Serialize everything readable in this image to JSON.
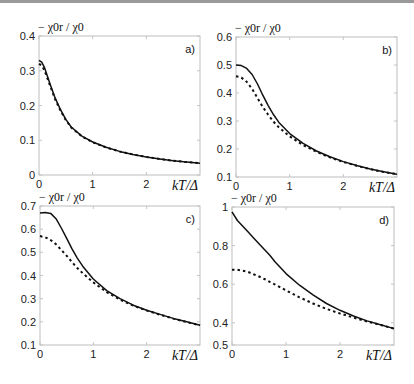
{
  "figure": {
    "width": 414,
    "height": 384,
    "line_color": "#111111",
    "frame_color": "#bdbdbd"
  },
  "chart_data": [
    {
      "type": "line",
      "panel_label": "a)",
      "title": "",
      "ylabel": "− χ0r / χ0",
      "xlabel": "kT/Δ",
      "xlim": [
        0,
        3
      ],
      "ylim": [
        0,
        0.4
      ],
      "xticks": [
        0,
        1,
        2
      ],
      "xtick_labels": [
        "0",
        "1",
        "2"
      ],
      "yticks": [
        0,
        0.1,
        0.2,
        0.3,
        0.4
      ],
      "ytick_labels": [
        "0",
        "0.1",
        "0.2",
        "0.3",
        "0.4"
      ],
      "frame_px": {
        "x0": 39,
        "y0": 36,
        "x1": 200,
        "y1": 175
      },
      "grid": false,
      "series": [
        {
          "name": "solid",
          "style": "solid",
          "x": [
            0,
            0.05,
            0.1,
            0.2,
            0.3,
            0.4,
            0.5,
            0.6,
            0.8,
            1.0,
            1.25,
            1.5,
            1.75,
            2.0,
            2.25,
            2.5,
            2.75,
            3.0
          ],
          "y": [
            0.33,
            0.325,
            0.31,
            0.265,
            0.222,
            0.188,
            0.16,
            0.138,
            0.112,
            0.095,
            0.08,
            0.068,
            0.059,
            0.052,
            0.046,
            0.041,
            0.037,
            0.034
          ]
        },
        {
          "name": "dashed",
          "style": "dashed",
          "x": [
            0,
            0.05,
            0.1,
            0.2,
            0.3,
            0.4,
            0.5,
            0.6,
            0.8,
            1.0,
            1.25,
            1.5,
            1.75,
            2.0,
            2.25,
            2.5,
            2.75,
            3.0
          ],
          "y": [
            0.32,
            0.315,
            0.302,
            0.26,
            0.218,
            0.185,
            0.158,
            0.137,
            0.111,
            0.094,
            0.079,
            0.068,
            0.059,
            0.052,
            0.046,
            0.041,
            0.037,
            0.034
          ]
        }
      ]
    },
    {
      "type": "line",
      "panel_label": "b)",
      "title": "",
      "ylabel": "− χ0r / χ0",
      "xlabel": "kT/Δ",
      "xlim": [
        0,
        3
      ],
      "ylim": [
        0.1,
        0.6
      ],
      "xticks": [
        0,
        1,
        2
      ],
      "xtick_labels": [
        "0",
        "1",
        "2"
      ],
      "yticks": [
        0.1,
        0.2,
        0.3,
        0.4,
        0.5,
        0.6
      ],
      "ytick_labels": [
        "0.1",
        "0.2",
        "0.3",
        "0.4",
        "0.5",
        "0.6"
      ],
      "frame_px": {
        "x0": 236,
        "y0": 37,
        "x1": 397,
        "y1": 177
      },
      "grid": false,
      "series": [
        {
          "name": "solid",
          "style": "solid",
          "x": [
            0,
            0.1,
            0.2,
            0.3,
            0.4,
            0.5,
            0.6,
            0.7,
            0.8,
            1.0,
            1.25,
            1.5,
            1.75,
            2.0,
            2.25,
            2.5,
            2.75,
            3.0
          ],
          "y": [
            0.5,
            0.498,
            0.488,
            0.466,
            0.432,
            0.392,
            0.355,
            0.322,
            0.295,
            0.255,
            0.22,
            0.193,
            0.172,
            0.155,
            0.141,
            0.129,
            0.119,
            0.11
          ]
        },
        {
          "name": "dashed",
          "style": "dashed",
          "x": [
            0,
            0.1,
            0.2,
            0.3,
            0.4,
            0.5,
            0.6,
            0.7,
            0.8,
            1.0,
            1.25,
            1.5,
            1.75,
            2.0,
            2.25,
            2.5,
            2.75,
            3.0
          ],
          "y": [
            0.46,
            0.455,
            0.44,
            0.415,
            0.382,
            0.35,
            0.322,
            0.297,
            0.277,
            0.245,
            0.214,
            0.19,
            0.17,
            0.154,
            0.14,
            0.128,
            0.118,
            0.11
          ]
        }
      ]
    },
    {
      "type": "line",
      "panel_label": "c)",
      "title": "",
      "ylabel": "− χ0r / χ0",
      "xlabel": "kT/Δ",
      "xlim": [
        0,
        3
      ],
      "ylim": [
        0.1,
        0.7
      ],
      "xticks": [
        0,
        1,
        2
      ],
      "xtick_labels": [
        "0",
        "1",
        "2"
      ],
      "yticks": [
        0.1,
        0.2,
        0.3,
        0.4,
        0.5,
        0.6,
        0.7
      ],
      "ytick_labels": [
        "0.1",
        "0.2",
        "0.3",
        "0.4",
        "0.5",
        "0.6",
        "0.7"
      ],
      "frame_px": {
        "x0": 40,
        "y0": 206,
        "x1": 200,
        "y1": 345
      },
      "grid": false,
      "series": [
        {
          "name": "solid",
          "style": "solid",
          "x": [
            0,
            0.1,
            0.2,
            0.3,
            0.4,
            0.5,
            0.6,
            0.7,
            0.8,
            1.0,
            1.25,
            1.5,
            1.75,
            2.0,
            2.25,
            2.5,
            2.75,
            3.0
          ],
          "y": [
            0.67,
            0.672,
            0.668,
            0.645,
            0.605,
            0.56,
            0.515,
            0.475,
            0.44,
            0.385,
            0.335,
            0.3,
            0.272,
            0.25,
            0.232,
            0.215,
            0.2,
            0.185
          ]
        },
        {
          "name": "dashed",
          "style": "dashed",
          "x": [
            0,
            0.1,
            0.2,
            0.3,
            0.4,
            0.5,
            0.6,
            0.7,
            0.8,
            1.0,
            1.25,
            1.5,
            1.75,
            2.0,
            2.25,
            2.5,
            2.75,
            3.0
          ],
          "y": [
            0.57,
            0.565,
            0.553,
            0.535,
            0.51,
            0.485,
            0.458,
            0.432,
            0.41,
            0.37,
            0.328,
            0.296,
            0.27,
            0.249,
            0.231,
            0.214,
            0.199,
            0.185
          ]
        }
      ]
    },
    {
      "type": "line",
      "panel_label": "d)",
      "title": "",
      "ylabel": "− χ0r / χ0",
      "xlabel": "kT/Δ",
      "xlim": [
        0,
        3
      ],
      "ylim": [
        0.285,
        1.0
      ],
      "xticks": [
        0,
        1,
        2
      ],
      "xtick_labels": [
        "0",
        "1",
        "2"
      ],
      "yticks": [
        0.285,
        0.4,
        0.6,
        0.8,
        1.0
      ],
      "ytick_labels": [
        "0.5",
        "0.4",
        "0.6",
        "0.8",
        "1"
      ],
      "frame_px": {
        "x0": 232,
        "y0": 207,
        "x1": 394,
        "y1": 345
      },
      "grid": false,
      "series": [
        {
          "name": "solid",
          "style": "solid",
          "x": [
            0,
            0.1,
            0.2,
            0.3,
            0.4,
            0.5,
            0.6,
            0.7,
            0.8,
            1.0,
            1.25,
            1.5,
            1.75,
            2.0,
            2.25,
            2.5,
            2.75,
            3.0
          ],
          "y": [
            0.975,
            0.93,
            0.9,
            0.87,
            0.84,
            0.81,
            0.78,
            0.75,
            0.715,
            0.655,
            0.595,
            0.545,
            0.5,
            0.465,
            0.435,
            0.41,
            0.39,
            0.37
          ]
        },
        {
          "name": "dashed",
          "style": "dashed",
          "x": [
            0,
            0.1,
            0.2,
            0.3,
            0.4,
            0.5,
            0.6,
            0.7,
            0.8,
            1.0,
            1.25,
            1.5,
            1.75,
            2.0,
            2.25,
            2.5,
            2.75,
            3.0
          ],
          "y": [
            0.675,
            0.675,
            0.67,
            0.663,
            0.652,
            0.64,
            0.627,
            0.612,
            0.598,
            0.568,
            0.532,
            0.5,
            0.472,
            0.448,
            0.427,
            0.407,
            0.389,
            0.37
          ]
        }
      ]
    }
  ]
}
